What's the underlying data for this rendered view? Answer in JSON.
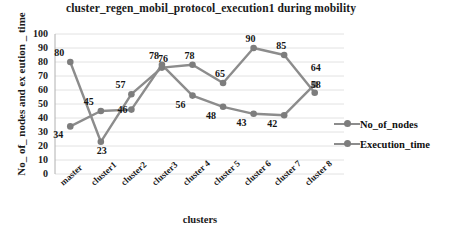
{
  "chart_data": {
    "type": "line",
    "title": "cluster_regen_mobil_protocol_execution1  during mobility",
    "xlabel": "clusters",
    "ylabel": "No_ of_ nodes and ex eution _ time",
    "categories": [
      "master",
      "cluster1",
      "cluster2",
      "cluster3",
      "cluster 4",
      "cluster 5",
      "cluster 6",
      "cluster 7",
      "cluster 8"
    ],
    "series": [
      {
        "name": "No_of_nodes",
        "values": [
          34,
          45,
          46,
          78,
          56,
          48,
          43,
          42,
          64
        ],
        "color": "#8c8c8c"
      },
      {
        "name": "Execution_time",
        "values": [
          80,
          23,
          57,
          76,
          78,
          65,
          90,
          85,
          58
        ],
        "color": "#8c8c8c"
      }
    ],
    "ylim": [
      0,
      100
    ],
    "ytick_step": 10,
    "yticks": [
      100,
      90,
      80,
      70,
      60,
      50,
      40,
      30,
      20,
      10,
      0
    ],
    "grid": true,
    "legend_position": "right",
    "point_labels": {
      "master": [
        "34",
        "80"
      ],
      "cluster1": [
        "45",
        "23"
      ],
      "cluster2": [
        "45",
        "57"
      ],
      "cluster3": [
        "78",
        "76"
      ],
      "cluster 4": [
        "56",
        "78"
      ],
      "cluster 5": [
        "48",
        "65"
      ],
      "cluster 6": [
        "43",
        "90"
      ],
      "cluster 7": [
        "42",
        "85"
      ],
      "cluster 8": [
        "64",
        "58"
      ]
    }
  },
  "legend": {
    "items": [
      {
        "label": "No_of_nodes"
      },
      {
        "label": "Execution_time"
      }
    ]
  }
}
